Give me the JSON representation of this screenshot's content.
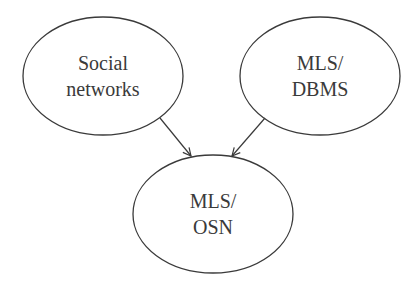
{
  "diagram": {
    "nodes": [
      {
        "id": "social",
        "lines": [
          "Social",
          "networks"
        ],
        "cx": 103,
        "cy": 76,
        "rx": 80,
        "ry": 60
      },
      {
        "id": "dbms",
        "lines": [
          "MLS/",
          "DBMS"
        ],
        "cx": 320,
        "cy": 76,
        "rx": 80,
        "ry": 60
      },
      {
        "id": "osn",
        "lines": [
          "MLS/",
          "OSN"
        ],
        "cx": 213,
        "cy": 213,
        "rx": 80,
        "ry": 60
      }
    ],
    "edges": [
      {
        "from": "social",
        "to": "osn"
      },
      {
        "from": "dbms",
        "to": "osn"
      }
    ],
    "colors": {
      "stroke": "#3a3a3a",
      "background": "#ffffff"
    }
  }
}
